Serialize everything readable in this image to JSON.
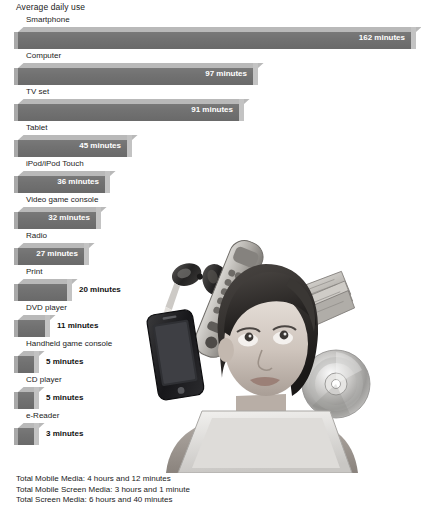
{
  "title": "Average daily use",
  "colors": {
    "bar_face": "#6f6f6f",
    "bar_top": "#b9b9b9",
    "bar_cap": "#c3c3c3",
    "text": "#1b1b1b",
    "value_inside": "#ffffff",
    "value_outside": "#111111"
  },
  "photo": {
    "alt": "Young woman looking upward surrounded by floating media devices",
    "items": [
      "car-keys",
      "tv-remote",
      "newspaper",
      "smartphone",
      "compact-disc",
      "laptop"
    ]
  },
  "totals": [
    "Total Mobile Media: 4 hours and 12 minutes",
    "Total Mobile Screen Media: 3 hours and 1 minute",
    "Total Screen Media: 6 hours and 40 minutes"
  ],
  "chart_data": {
    "type": "bar",
    "title": "Average daily use",
    "xlabel": "",
    "ylabel": "",
    "orientation": "horizontal",
    "unit": "minutes",
    "grid": false,
    "legend": false,
    "xlim": [
      0,
      162
    ],
    "categories": [
      "Smartphone",
      "Computer",
      "TV set",
      "Tablet",
      "iPod/iPod Touch",
      "Video game console",
      "Radio",
      "Print",
      "DVD player",
      "Handheld game console",
      "CD player",
      "e-Reader"
    ],
    "values": [
      162,
      97,
      91,
      45,
      36,
      32,
      27,
      20,
      11,
      5,
      5,
      3
    ],
    "value_labels": [
      "162 minutes",
      "97 minutes",
      "91 minutes",
      "45 minutes",
      "36 minutes",
      "32 minutes",
      "27 minutes",
      "20 minutes",
      "11 minutes",
      "5 minutes",
      "5 minutes",
      "3 minutes"
    ]
  }
}
